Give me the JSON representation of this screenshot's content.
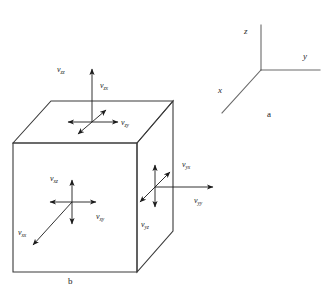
{
  "figure": {
    "background_color": "#ffffff",
    "line_color": "#3a3a3a",
    "arrow_color": "#1b1b1b",
    "text_color": "#1b1b1b"
  },
  "panel_a": {
    "caption": "a",
    "axes": [
      {
        "name": "z",
        "label": "z",
        "direction": "up"
      },
      {
        "name": "y",
        "label": "y",
        "direction": "right"
      },
      {
        "name": "x",
        "label": "x",
        "direction": "down-left"
      }
    ]
  },
  "panel_b": {
    "caption": "b",
    "shape": "cube",
    "faces": [
      {
        "name": "top-face",
        "stress_labels": [
          {
            "symbol": "v",
            "sub": "zz",
            "text": "vzz"
          },
          {
            "symbol": "v",
            "sub": "zx",
            "text": "vzx"
          },
          {
            "symbol": "v",
            "sub": "zy",
            "text": "vzy"
          }
        ]
      },
      {
        "name": "front-face",
        "stress_labels": [
          {
            "symbol": "v",
            "sub": "xz",
            "text": "vxz"
          },
          {
            "symbol": "v",
            "sub": "xy",
            "text": "vxy"
          },
          {
            "symbol": "v",
            "sub": "xx",
            "text": "vxx"
          }
        ]
      },
      {
        "name": "right-face",
        "stress_labels": [
          {
            "symbol": "v",
            "sub": "yx",
            "text": "vyx"
          },
          {
            "symbol": "v",
            "sub": "yy",
            "text": "vyy"
          },
          {
            "symbol": "v",
            "sub": "yz",
            "text": "vyz"
          }
        ]
      }
    ]
  },
  "labels": {
    "top_zz": {
      "sym": "v",
      "sub": "zz"
    },
    "top_zx": {
      "sym": "v",
      "sub": "zx"
    },
    "top_zy": {
      "sym": "v",
      "sub": "zy"
    },
    "front_xz": {
      "sym": "v",
      "sub": "xz"
    },
    "front_xy": {
      "sym": "v",
      "sub": "xy"
    },
    "front_xx": {
      "sym": "v",
      "sub": "xx"
    },
    "right_yx": {
      "sym": "v",
      "sub": "yx"
    },
    "right_yy": {
      "sym": "v",
      "sub": "yy"
    },
    "right_yz": {
      "sym": "v",
      "sub": "yz"
    },
    "axis_z": "z",
    "axis_y": "y",
    "axis_x": "x",
    "caption_a": "a",
    "caption_b": "b"
  }
}
